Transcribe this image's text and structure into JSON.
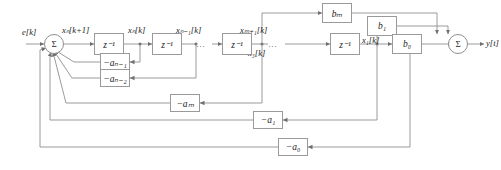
{
  "diagram": {
    "type": "block-diagram",
    "line_color": "#8f8f8f",
    "block_border_color": "#9a9a9a",
    "text_color": "#1a1a1a",
    "background": "#ffffff"
  },
  "signals": {
    "input": "e[k]",
    "output": "y[t]",
    "state_next": "xₙ[k+1]",
    "state_n": "xₙ[k]",
    "state_n_minus_1": "xₙ₋₁[k]",
    "state_m_plus_1": "xₘ₊₁[k]",
    "state_3": "x₃[k]",
    "state_1": "x₁[k]",
    "ellipsis_mid": "…",
    "ellipsis_right": "…"
  },
  "sums": {
    "input_sum": "Σ",
    "output_sum": "Σ"
  },
  "delays": [
    {
      "name": "delay-1",
      "label": "z⁻¹"
    },
    {
      "name": "delay-2",
      "label": "z⁻¹"
    },
    {
      "name": "delay-3",
      "label": "z⁻¹"
    },
    {
      "name": "delay-4",
      "label": "z⁻¹"
    },
    {
      "name": "delay-5",
      "label": "z⁻¹"
    }
  ],
  "feedforward": [
    {
      "name": "gain-bm",
      "label": "bₘ"
    },
    {
      "name": "gain-b1",
      "label": "b₁"
    },
    {
      "name": "gain-b0",
      "label": "b₀"
    }
  ],
  "feedback": [
    {
      "name": "gain-neg-a-n-1",
      "label": "−aₙ₋₁"
    },
    {
      "name": "gain-neg-a-n-2",
      "label": "−aₙ₋₂"
    },
    {
      "name": "gain-neg-am",
      "label": "−aₘ"
    },
    {
      "name": "gain-neg-a1",
      "label": "−a₁"
    },
    {
      "name": "gain-neg-a0",
      "label": "−a₀"
    }
  ]
}
